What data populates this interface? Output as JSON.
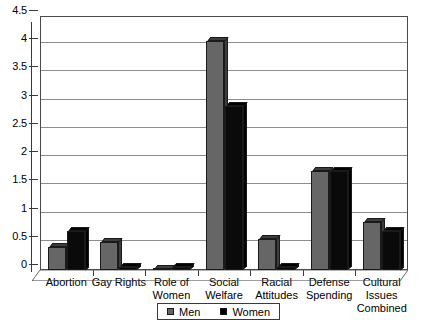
{
  "chart_data": {
    "type": "bar",
    "title": "",
    "subtitle": "",
    "xlabel": "",
    "ylabel": "",
    "ylim": [
      0,
      4.5
    ],
    "grid": true,
    "legend_position": "bottom",
    "categories": [
      "Abortion",
      "Gay Rights",
      "Role of\nWomen",
      "Social\nWelfare",
      "Racial\nAttitudes",
      "Defense\nSpending",
      "Cultural Issues\nCombined"
    ],
    "y_ticks": [
      "0",
      "0.5",
      "1",
      "1.5",
      "2",
      "2.5",
      "3",
      "3.5",
      "4",
      "4.5"
    ],
    "y_tick_values": [
      0,
      0.5,
      1,
      1.5,
      2,
      2.5,
      3,
      3.5,
      4,
      4.5
    ],
    "series": [
      {
        "name": "Men",
        "color": "#666666",
        "values": [
          0.4,
          0.5,
          0.0,
          4.05,
          0.55,
          1.75,
          0.85
        ]
      },
      {
        "name": "Women",
        "color": "#000000",
        "values": [
          0.7,
          0.05,
          0.05,
          2.9,
          0.05,
          1.75,
          0.7
        ]
      }
    ]
  },
  "legend": {
    "entries": [
      {
        "label": "Men",
        "swatch": "men-swatch"
      },
      {
        "label": "Women",
        "swatch": "women-swatch"
      }
    ]
  },
  "colors": {
    "men": "#666666",
    "women": "#000000",
    "gridline": "#8d8d8d",
    "axis": "#3a3a3a",
    "background": "#ffffff"
  }
}
